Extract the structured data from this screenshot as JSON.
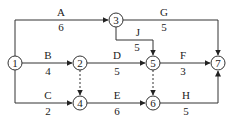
{
  "diagram": {
    "type": "activity-on-arrow network",
    "nodes": [
      {
        "id": "1",
        "label": "1",
        "x": 15,
        "y": 63
      },
      {
        "id": "2",
        "label": "2",
        "x": 80,
        "y": 63
      },
      {
        "id": "3",
        "label": "3",
        "x": 116,
        "y": 20
      },
      {
        "id": "4",
        "label": "4",
        "x": 80,
        "y": 103
      },
      {
        "id": "5",
        "label": "5",
        "x": 153,
        "y": 63
      },
      {
        "id": "6",
        "label": "6",
        "x": 153,
        "y": 103
      },
      {
        "id": "7",
        "label": "7",
        "x": 218,
        "y": 63
      }
    ],
    "activities": [
      {
        "name": "A",
        "duration": "6",
        "from": "1",
        "to": "3"
      },
      {
        "name": "B",
        "duration": "4",
        "from": "1",
        "to": "2"
      },
      {
        "name": "C",
        "duration": "2",
        "from": "1",
        "to": "4"
      },
      {
        "name": "D",
        "duration": "5",
        "from": "2",
        "to": "5"
      },
      {
        "name": "E",
        "duration": "6",
        "from": "4",
        "to": "6"
      },
      {
        "name": "F",
        "duration": "3",
        "from": "5",
        "to": "7"
      },
      {
        "name": "G",
        "duration": "5",
        "from": "3",
        "to": "7"
      },
      {
        "name": "H",
        "duration": "5",
        "from": "6",
        "to": "7"
      },
      {
        "name": "J",
        "duration": "5",
        "from": "3",
        "to": "5"
      }
    ],
    "dummies": [
      {
        "from": "2",
        "to": "4"
      },
      {
        "from": "5",
        "to": "6"
      }
    ]
  }
}
